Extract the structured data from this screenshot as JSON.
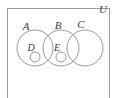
{
  "figure": {
    "stroke_color": "#8c8c8c",
    "label_color": "#3a3a3a",
    "background_color": "#ffffff"
  },
  "universe": {
    "label": "U",
    "label_x": 103,
    "label_y": 13,
    "rect": {
      "x": 7,
      "y": 8,
      "width": 103,
      "height": 92
    }
  },
  "sets": [
    {
      "id": "A",
      "label": "A",
      "cx": 35,
      "cy": 48,
      "r": 18,
      "label_x": 26,
      "label_y": 30
    },
    {
      "id": "B",
      "label": "B",
      "cx": 61,
      "cy": 48,
      "r": 18,
      "label_x": 58,
      "label_y": 29
    },
    {
      "id": "C",
      "label": "C",
      "cx": 85,
      "cy": 48,
      "r": 18,
      "label_x": 81,
      "label_y": 28
    }
  ],
  "subsets": [
    {
      "id": "D",
      "label": "D",
      "cx": 35,
      "cy": 57,
      "r": 5,
      "label_x": 31,
      "label_y": 51,
      "parent": "A"
    },
    {
      "id": "E",
      "label": "E",
      "cx": 61,
      "cy": 57,
      "r": 5,
      "label_x": 57,
      "label_y": 51,
      "parent": "B"
    }
  ]
}
